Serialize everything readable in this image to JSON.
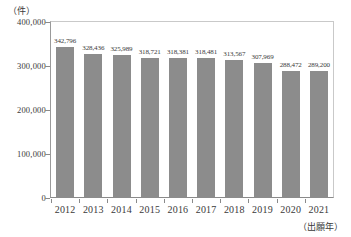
{
  "chart_data": {
    "type": "bar",
    "title": "",
    "xlabel": "（出願年）",
    "ylabel": "（件）",
    "categories": [
      "2012",
      "2013",
      "2014",
      "2015",
      "2016",
      "2017",
      "2018",
      "2019",
      "2020",
      "2021"
    ],
    "values": [
      342796,
      328436,
      325989,
      318721,
      318381,
      318481,
      313567,
      307969,
      288472,
      289200
    ],
    "value_labels": [
      "342,796",
      "328,436",
      "325,989",
      "318,721",
      "318,381",
      "318,481",
      "313,567",
      "307,969",
      "288,472",
      "289,200"
    ],
    "ylim": [
      0,
      400000
    ],
    "ytick_values": [
      0,
      100000,
      200000,
      300000,
      400000
    ],
    "ytick_labels": [
      "0",
      "100,000",
      "200,000",
      "300,000",
      "400,000"
    ],
    "grid": false,
    "legend": null,
    "series": [
      {
        "name": "件数",
        "values": [
          342796,
          328436,
          325989,
          318721,
          318381,
          318481,
          313567,
          307969,
          288472,
          289200
        ]
      }
    ],
    "bar_color": "#8c8c8c",
    "axis_color": "#8a8a8a",
    "text_color": "#3a3a3a",
    "background_color": "#ffffff"
  }
}
